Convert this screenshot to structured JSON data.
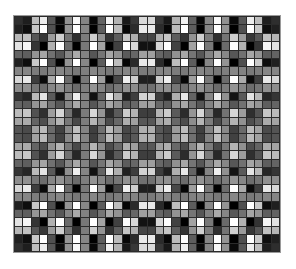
{
  "figure": {
    "width": 296,
    "height": 269,
    "background_color": "#ffffff",
    "title": "",
    "xlabel": "",
    "ylabel": ""
  },
  "plot_area": {
    "left": 14,
    "top": 16,
    "width": 266,
    "height": 236,
    "gridline_color": "#2b2b2b",
    "frame_color": "#9a9a9a"
  },
  "chart_data": {
    "type": "heatmap",
    "title": "",
    "subtitle": "",
    "xlabel": "",
    "ylabel": "",
    "legend": [],
    "legend_position": "none",
    "grid": true,
    "colormap": "gray",
    "colormap_min_color": "#000000",
    "colormap_max_color": "#ffffff",
    "n_cols": 32,
    "n_rows": 28,
    "value_min": 0,
    "value_max": 1,
    "xticklabels": [],
    "yticklabels": [],
    "generator": {
      "note": "Cell value at column i (0-based, left to right) and row j (0-based, top to bottom) is computed from the normalised radial/product-of-cosines interference formula below; the template evaluates it to fill the grid so no pixel values are hardcoded in markup.",
      "formula": "v = 0.5 + 0.5 * cos(PI * freq * u) * cos(PI * freq * w) * envelope",
      "u_definition": "u = (i + 0.5 - n_cols/2) / (n_cols/2)",
      "w_definition": "w = (j + 0.5 - n_rows/2) / (n_rows/2)",
      "freq_x": 7.5,
      "freq_y": 6.5,
      "envelope": "1 - 0.55 * (1 - |w|)",
      "contrast": 1.45,
      "gamma": 1.0
    }
  }
}
